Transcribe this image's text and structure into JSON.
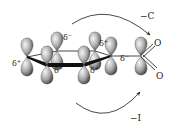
{
  "diagram": {
    "type": "orbital-diagram",
    "ring_atoms": [
      {
        "id": "back-left",
        "charge": "δ⁻"
      },
      {
        "id": "back-right",
        "charge": "δ⁺"
      },
      {
        "id": "left",
        "charge": "δ⁺"
      },
      {
        "id": "front-left",
        "charge": "δ⁻"
      },
      {
        "id": "front-right",
        "charge": "δ⁺"
      },
      {
        "id": "ipso",
        "charge": "δ⁻"
      }
    ],
    "substituent": {
      "center": "S",
      "oxygens": [
        "O",
        "O"
      ]
    },
    "effects": [
      {
        "id": "mesomeric",
        "label": "−C",
        "position": "top"
      },
      {
        "id": "inductive",
        "label": "−I",
        "position": "bottom"
      }
    ],
    "colors": {
      "lobe_light": "#f4f4f4",
      "lobe_dark": "#3a3a3a",
      "line": "#1a1a1a",
      "background": "#ffffff"
    }
  }
}
